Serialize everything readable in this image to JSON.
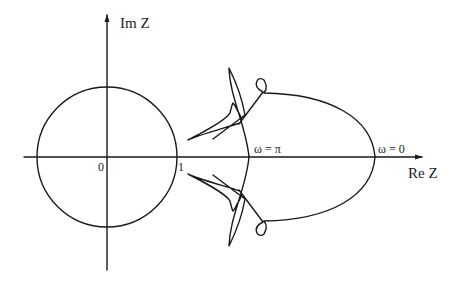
{
  "diagram": {
    "axes": {
      "x_label": "Re Z",
      "y_label": "Im Z"
    },
    "tick_labels": {
      "origin": "0",
      "unit": "1"
    },
    "annotations": {
      "omega_pi": "ω = π",
      "omega_zero": "ω = 0"
    },
    "elements": [
      {
        "name": "unit-circle",
        "description": "circle of radius 1 centered at origin"
      },
      {
        "name": "frequency-response-curve",
        "description": "closed locus symmetric about the real axis, crossing the real axis at ω = 0 and ω = π, with small loops and cusps near the unit circle"
      }
    ]
  }
}
